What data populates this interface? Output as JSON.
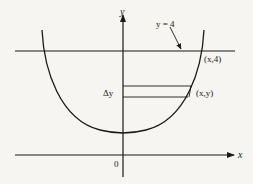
{
  "diagram": {
    "axes": {
      "y_label": "y",
      "x_label": "x",
      "origin_label": "0"
    },
    "line": {
      "label": "y = 4",
      "point_label": "(x,4)"
    },
    "strip": {
      "height_label": "Δy",
      "point_label": "(x,y)"
    },
    "colors": {
      "stroke": "#1a1a1a",
      "background": "#f6f5f2"
    }
  }
}
